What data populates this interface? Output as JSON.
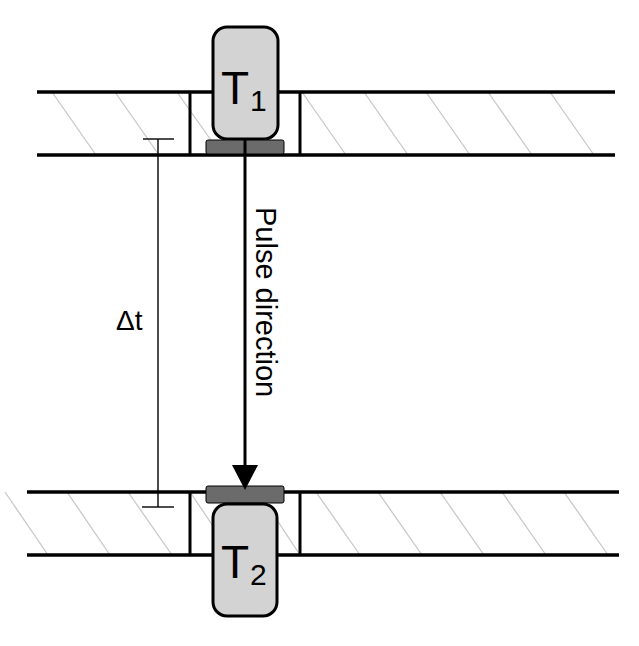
{
  "diagram": {
    "transducers": [
      {
        "id": "T1",
        "label_main": "T",
        "label_sub": "1",
        "position": "top"
      },
      {
        "id": "T2",
        "label_main": "T",
        "label_sub": "2",
        "position": "bottom"
      }
    ],
    "arrow_label": "Pulse direction",
    "dimension_label": "Δt",
    "colors": {
      "pipe_wall": "#000000",
      "hatch": "#c8c8c8",
      "transducer_fill": "#d3d3d3",
      "transducer_stroke": "#000000",
      "pad_fill": "#6b6b6b",
      "background": "#ffffff"
    }
  }
}
